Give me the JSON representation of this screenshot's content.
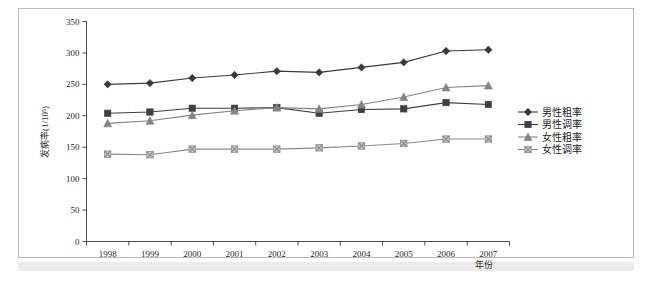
{
  "figure": {
    "background": "#ffffff",
    "frame_color": "#b9b9b9"
  },
  "chart_data": {
    "type": "line",
    "title": "",
    "xlabel": "年份",
    "ylabel": "发病率(1/10⁵)",
    "x": [
      "1998",
      "1999",
      "2000",
      "2001",
      "2002",
      "2003",
      "2004",
      "2005",
      "2006",
      "2007"
    ],
    "categories": [
      "1998",
      "1999",
      "2000",
      "2001",
      "2002",
      "2003",
      "2004",
      "2005",
      "2006",
      "2007"
    ],
    "xlim": [
      1998,
      2007
    ],
    "ylim": [
      0,
      350
    ],
    "yticks": [
      0,
      50,
      100,
      150,
      200,
      250,
      300,
      350
    ],
    "ytick_labels": [
      "0",
      "50",
      "100",
      "150",
      "200",
      "250",
      "300",
      "350"
    ],
    "grid": false,
    "legend_position": "right",
    "series": [
      {
        "name": "男性粗率",
        "marker": "diamond",
        "color": "#3a3a3a",
        "values": [
          250,
          252,
          260,
          265,
          271,
          269,
          277,
          285,
          303,
          305
        ]
      },
      {
        "name": "男性调率",
        "marker": "square",
        "color": "#3f3f3f",
        "values": [
          204,
          206,
          212,
          212,
          213,
          204,
          210,
          211,
          221,
          218
        ]
      },
      {
        "name": "女性粗率",
        "marker": "triangle",
        "color": "#848484",
        "values": [
          188,
          192,
          201,
          208,
          213,
          211,
          218,
          230,
          245,
          248
        ]
      },
      {
        "name": "女性调率",
        "marker": "x-square",
        "color": "#8a8a8a",
        "values": [
          139,
          138,
          147,
          147,
          147,
          149,
          152,
          156,
          163,
          163
        ]
      }
    ]
  },
  "legend": {
    "items": [
      {
        "label": "男性粗率"
      },
      {
        "label": "男性调率"
      },
      {
        "label": "女性粗率"
      },
      {
        "label": "女性调率"
      }
    ]
  }
}
